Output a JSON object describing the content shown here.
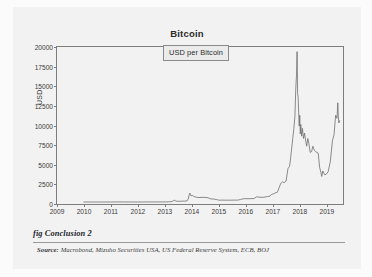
{
  "figure": {
    "caption": "fig Conclusion 2",
    "source_label": "Source:",
    "source_text": "Macrobond, Mizuho Securities USA, US Federal Reserve System, ECB, BOJ",
    "panel_background": "#f2f2f2",
    "page_background": "#fbfbfb"
  },
  "chart_data": {
    "type": "line",
    "title": "Bitcoin",
    "xlabel": "",
    "ylabel": "USD",
    "legend": [
      "USD per Bitcoin"
    ],
    "legend_position": "inside-top-center",
    "grid": false,
    "line_color": "#6d6d6d",
    "axis_color": "#7d7d7d",
    "xlim": [
      2009,
      2019.6
    ],
    "ylim": [
      0,
      20000
    ],
    "yticks": [
      0,
      2500,
      5000,
      7500,
      10000,
      12500,
      15000,
      17500,
      20000
    ],
    "ytick_labels": [
      "0",
      "2500",
      "5000",
      "7500",
      "10000",
      "12500",
      "15000",
      "17500",
      "20000"
    ],
    "xticks": [
      2009,
      2010,
      2011,
      2012,
      2013,
      2014,
      2015,
      2016,
      2017,
      2018,
      2019
    ],
    "xtick_labels": [
      "2009",
      "2010",
      "2011",
      "2012",
      "2013",
      "2014",
      "2015",
      "2016",
      "2017",
      "2018",
      "2019"
    ],
    "series": [
      {
        "name": "USD per Bitcoin",
        "x": [
          2010.0,
          2010.25,
          2010.5,
          2010.75,
          2011.0,
          2011.2,
          2011.45,
          2011.55,
          2011.7,
          2011.85,
          2012.0,
          2012.2,
          2012.4,
          2012.6,
          2012.8,
          2012.95,
          2013.05,
          2013.15,
          2013.25,
          2013.3,
          2013.33,
          2013.38,
          2013.45,
          2013.55,
          2013.65,
          2013.75,
          2013.85,
          2013.9,
          2013.93,
          2013.96,
          2014.0,
          2014.05,
          2014.12,
          2014.2,
          2014.3,
          2014.45,
          2014.6,
          2014.75,
          2014.85,
          2014.95,
          2015.05,
          2015.15,
          2015.3,
          2015.45,
          2015.6,
          2015.75,
          2015.85,
          2015.95,
          2016.05,
          2016.2,
          2016.35,
          2016.45,
          2016.55,
          2016.7,
          2016.85,
          2016.95,
          2017.0,
          2017.08,
          2017.15,
          2017.22,
          2017.28,
          2017.35,
          2017.42,
          2017.48,
          2017.55,
          2017.62,
          2017.68,
          2017.72,
          2017.76,
          2017.8,
          2017.84,
          2017.88,
          2017.91,
          2017.94,
          2017.96,
          2017.97,
          2017.98,
          2018.0,
          2018.02,
          2018.04,
          2018.06,
          2018.08,
          2018.1,
          2018.13,
          2018.16,
          2018.2,
          2018.24,
          2018.28,
          2018.32,
          2018.36,
          2018.4,
          2018.45,
          2018.5,
          2018.55,
          2018.6,
          2018.65,
          2018.7,
          2018.75,
          2018.8,
          2018.85,
          2018.88,
          2018.92,
          2018.96,
          2019.0,
          2019.05,
          2019.12,
          2019.2,
          2019.28,
          2019.34,
          2019.4,
          2019.45,
          2019.48,
          2019.5,
          2019.52,
          2019.55
        ],
        "y": [
          0,
          0,
          0,
          0,
          0,
          15,
          12,
          8,
          5,
          4,
          5,
          5,
          8,
          11,
          12,
          13,
          15,
          25,
          45,
          80,
          140,
          230,
          110,
          95,
          105,
          120,
          135,
          400,
          900,
          1150,
          800,
          850,
          700,
          620,
          580,
          600,
          580,
          400,
          380,
          320,
          230,
          250,
          235,
          240,
          245,
          250,
          320,
          420,
          430,
          430,
          450,
          670,
          620,
          610,
          700,
          760,
          970,
          1050,
          1180,
          1250,
          1750,
          2400,
          2600,
          2500,
          2700,
          4300,
          4600,
          5700,
          7000,
          8200,
          9500,
          11000,
          14500,
          16500,
          19400,
          17000,
          14000,
          13500,
          11500,
          9800,
          11200,
          8800,
          10000,
          8500,
          9500,
          8200,
          8900,
          7900,
          7200,
          8200,
          7600,
          6400,
          6500,
          7200,
          6700,
          6500,
          6400,
          6300,
          4500,
          3800,
          3300,
          4000,
          3700,
          3500,
          3600,
          3900,
          5200,
          7900,
          8700,
          11200,
          10800,
          12800,
          11000,
          10200,
          10500
        ]
      }
    ]
  }
}
